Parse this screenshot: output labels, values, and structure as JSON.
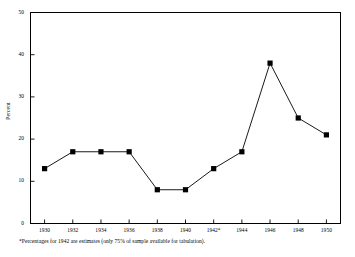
{
  "chart_data": {
    "type": "line",
    "title": "",
    "subtitle": "",
    "xlabel": "",
    "ylabel": "Percent",
    "categories": [
      "1930",
      "1932",
      "1934",
      "1936",
      "1938",
      "1940",
      "1942*",
      "1944",
      "1946",
      "1948",
      "1950"
    ],
    "x": [
      1930,
      1932,
      1934,
      1936,
      1938,
      1940,
      1942,
      1944,
      1946,
      1948,
      1950
    ],
    "values": [
      13,
      17,
      17,
      17,
      8,
      8,
      13,
      17,
      38,
      25,
      21
    ],
    "series": [
      {
        "name": "Percent",
        "values": [
          13,
          17,
          17,
          17,
          8,
          8,
          13,
          17,
          38,
          25,
          21
        ]
      }
    ],
    "ylim": [
      0,
      50
    ],
    "yticks": [
      0,
      10,
      20,
      30,
      40,
      50
    ],
    "ytick_labels": [
      "0",
      "10",
      "20",
      "30",
      "40",
      "50"
    ],
    "xtick_labels": [
      "1930",
      "1932",
      "1934",
      "1936",
      "1938",
      "1940",
      "1942*",
      "1944",
      "1946",
      "1948",
      "1950"
    ],
    "grid": false,
    "legend": null,
    "legend_position": "none",
    "marker": "square",
    "marker_color": "#000000",
    "line_color": "#000000",
    "background_color": "#ffffff",
    "frame_color": "#000000",
    "annotations": [
      "*Percentages for 1942 are estimates (only 75% of sample available for tabulation)."
    ]
  },
  "footnote": {
    "text": "*Percentages for 1942 are estimates (only 75% of sample available for tabulation)."
  },
  "axes": {
    "y_title": "Percent"
  }
}
